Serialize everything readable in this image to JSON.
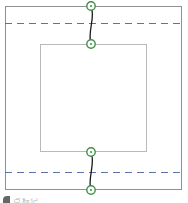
{
  "view": {
    "width": 188,
    "height": 203,
    "background": "#ffffff"
  },
  "colors": {
    "outer_boundary": "#909090",
    "inner_boundary": "#b9b9b9",
    "dashed_guide": "#5f6fa8",
    "node_marker_stroke": "#3f8f4a",
    "node_marker_fill": "#ffffff",
    "connector": "#1a1a1a",
    "caption_text": "#8d8d8d"
  },
  "shapes": {
    "outer_rect": {
      "label": "outer-boundary-rectangle",
      "x": 5,
      "y": 6,
      "width": 177,
      "height": 184,
      "stroke_width": 1
    },
    "inner_rect": {
      "label": "inner-boundary-rectangle",
      "x": 40,
      "y": 44,
      "width": 107,
      "height": 108,
      "stroke_width": 1
    }
  },
  "guides": [
    {
      "name": "upper-dashed-guide",
      "y": 23,
      "x1": 5,
      "x2": 182,
      "dash": "7 5"
    },
    {
      "name": "lower-dashed-guide",
      "y": 172,
      "x1": 5,
      "x2": 182,
      "dash": "7 5"
    }
  ],
  "nodes": [
    {
      "name": "node-top-outer",
      "x": 91,
      "y": 6,
      "radius": 4.2
    },
    {
      "name": "node-top-inner",
      "x": 91,
      "y": 44,
      "radius": 4.2
    },
    {
      "name": "node-bottom-inner",
      "x": 91,
      "y": 152,
      "radius": 4.2
    },
    {
      "name": "node-bottom-outer",
      "x": 91,
      "y": 190,
      "radius": 4.2
    }
  ],
  "connectors": [
    {
      "name": "connector-top",
      "path": "M 91 6 C 96 17, 87 32, 91 44"
    },
    {
      "name": "connector-bottom",
      "path": "M 91 152 C 96 163, 87 179, 91 190"
    }
  ],
  "caption": {
    "bullet_glyph": "marker-swatch",
    "text": "点标记"
  }
}
